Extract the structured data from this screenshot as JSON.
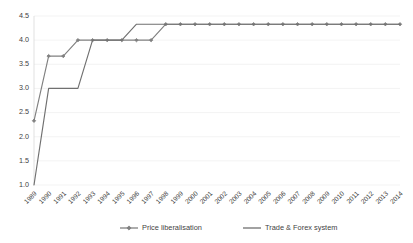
{
  "chart_data": {
    "type": "line",
    "title": "",
    "xlabel": "",
    "ylabel": "",
    "ylim": [
      1.0,
      4.5
    ],
    "ytick_labels": [
      "1.0",
      "1.5",
      "2.0",
      "2.5",
      "3.0",
      "3.5",
      "4.0",
      "4.5"
    ],
    "ytick_values": [
      1.0,
      1.5,
      2.0,
      2.5,
      3.0,
      3.5,
      4.0,
      4.5
    ],
    "grid": true,
    "legend_position": "bottom",
    "categories": [
      "1989",
      "1990",
      "1991",
      "1992",
      "1993",
      "1994",
      "1995",
      "1996",
      "1997",
      "1998",
      "1999",
      "2000",
      "2001",
      "2002",
      "2003",
      "2004",
      "2005",
      "2006",
      "2007",
      "2008",
      "2009",
      "2010",
      "2011",
      "2012",
      "2013",
      "2014"
    ],
    "series": [
      {
        "name": "Price liberalisation",
        "color": "#808080",
        "marker": "diamond",
        "values": [
          2.33,
          3.67,
          3.67,
          4.0,
          4.0,
          4.0,
          4.0,
          4.0,
          4.0,
          4.33,
          4.33,
          4.33,
          4.33,
          4.33,
          4.33,
          4.33,
          4.33,
          4.33,
          4.33,
          4.33,
          4.33,
          4.33,
          4.33,
          4.33,
          4.33,
          4.33
        ]
      },
      {
        "name": "Trade & Forex system",
        "color": "#707070",
        "marker": "none",
        "values": [
          1.0,
          3.0,
          3.0,
          3.0,
          4.0,
          4.0,
          4.0,
          4.33,
          4.33,
          4.33,
          4.33,
          4.33,
          4.33,
          4.33,
          4.33,
          4.33,
          4.33,
          4.33,
          4.33,
          4.33,
          4.33,
          4.33,
          4.33,
          4.33,
          4.33,
          4.33
        ]
      }
    ]
  },
  "legend": {
    "items": [
      {
        "label": "Price liberalisation",
        "color": "#808080",
        "marker": "diamond"
      },
      {
        "label": "Trade & Forex system",
        "color": "#707070",
        "marker": "none"
      }
    ]
  },
  "colors": {
    "gridline": "#f0f0f0",
    "axis": "#d9d9d9",
    "tick_text": "#404040",
    "series_1": "#808080",
    "series_2": "#707070"
  }
}
